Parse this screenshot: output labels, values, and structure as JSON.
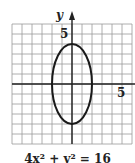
{
  "chart_data": {
    "type": "line",
    "title": "",
    "caption": "4x² + y² = 16",
    "xlabel": "",
    "ylabel": "y",
    "xlim": [
      -6,
      6
    ],
    "ylim": [
      -6,
      6
    ],
    "grid": true,
    "x_tick_labels": [
      {
        "value": 5,
        "label": "5"
      }
    ],
    "y_tick_labels": [
      {
        "value": 5,
        "label": "5"
      }
    ],
    "series": [
      {
        "name": "ellipse",
        "equation": "4x^2 + y^2 = 16",
        "shape": "ellipse",
        "center": [
          0,
          0
        ],
        "semi_axis_x": 2,
        "semi_axis_y": 4,
        "points": [
          [
            2,
            0
          ],
          [
            0,
            4
          ],
          [
            -2,
            0
          ],
          [
            0,
            -4
          ]
        ]
      }
    ]
  },
  "labels": {
    "y_axis": "y",
    "y_tick": "5",
    "x_tick": "5",
    "equation": "4x² + y² = 16"
  },
  "colors": {
    "grid": "#9a9a9a",
    "axis": "#222222",
    "curve": "#1a1a1a"
  }
}
